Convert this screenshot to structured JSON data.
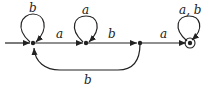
{
  "diagram": {
    "type": "finite-automaton",
    "states": [
      {
        "id": "q0",
        "x": 33,
        "y": 43,
        "initial": true,
        "accepting": false
      },
      {
        "id": "q1",
        "x": 86,
        "y": 43,
        "initial": false,
        "accepting": false
      },
      {
        "id": "q2",
        "x": 140,
        "y": 43,
        "initial": false,
        "accepting": false
      },
      {
        "id": "q3",
        "x": 190,
        "y": 43,
        "initial": false,
        "accepting": true
      }
    ],
    "transitions": [
      {
        "from": "q0",
        "to": "q0",
        "label": "b"
      },
      {
        "from": "q0",
        "to": "q1",
        "label": "a"
      },
      {
        "from": "q1",
        "to": "q1",
        "label": "a"
      },
      {
        "from": "q1",
        "to": "q2",
        "label": "b"
      },
      {
        "from": "q2",
        "to": "q3",
        "label": "a"
      },
      {
        "from": "q3",
        "to": "q3",
        "label": "a, b"
      },
      {
        "from": "q2",
        "to": "q0",
        "label": "b"
      }
    ],
    "colors": {
      "stroke": "#222222"
    }
  }
}
